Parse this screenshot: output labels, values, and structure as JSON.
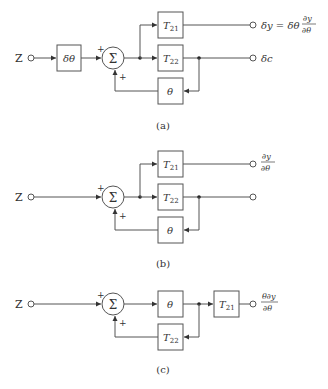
{
  "diagrams": [
    {
      "id": "a",
      "caption": "(a)",
      "input_label": "Z",
      "pre_block": "δθ",
      "sum_symbol": "Σ",
      "sum_signs": [
        "+",
        "+"
      ],
      "blocks": {
        "t21": "T",
        "t21_sub": "21",
        "t22": "T",
        "t22_sub": "22",
        "feedback": "θ"
      },
      "outputs": {
        "top_lhs": "δy = δθ",
        "top_num": "∂y",
        "top_den": "∂θ",
        "bottom": "δc"
      }
    },
    {
      "id": "b",
      "caption": "(b)",
      "input_label": "Z",
      "sum_symbol": "Σ",
      "sum_signs": [
        "+",
        "+"
      ],
      "blocks": {
        "t21": "T",
        "t21_sub": "21",
        "t22": "T",
        "t22_sub": "22",
        "feedback": "θ"
      },
      "outputs": {
        "top_num": "∂y",
        "top_den": "∂θ",
        "bottom": ""
      }
    },
    {
      "id": "c",
      "caption": "(c)",
      "input_label": "Z",
      "sum_symbol": "Σ",
      "sum_signs": [
        "+",
        "+"
      ],
      "blocks": {
        "forward": "θ",
        "t21": "T",
        "t21_sub": "21",
        "feedback": "T",
        "feedback_sub": "22"
      },
      "outputs": {
        "top_num": "θ∂y",
        "top_den": "∂θ"
      }
    }
  ]
}
